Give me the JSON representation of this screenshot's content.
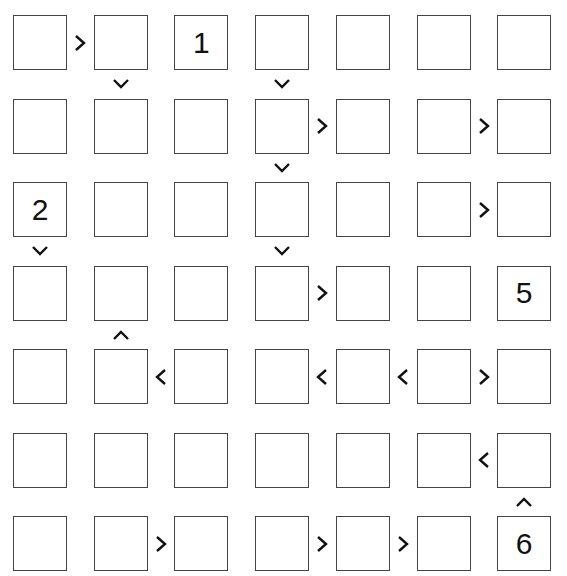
{
  "puzzle": {
    "type": "futoshiki",
    "size": 7,
    "grid": [
      [
        "",
        "",
        "1",
        "",
        "",
        "",
        ""
      ],
      [
        "",
        "",
        "",
        "",
        "",
        "",
        ""
      ],
      [
        "2",
        "",
        "",
        "",
        "",
        "",
        ""
      ],
      [
        "",
        "",
        "",
        "",
        "",
        "",
        "5"
      ],
      [
        "",
        "",
        "",
        "",
        "",
        "",
        ""
      ],
      [
        "",
        "",
        "",
        "",
        "",
        "",
        ""
      ],
      [
        "",
        "",
        "",
        "",
        "",
        "",
        "6"
      ]
    ],
    "horizontal_constraints": [
      {
        "row": 0,
        "col": 0,
        "sign": ">"
      },
      {
        "row": 1,
        "col": 3,
        "sign": ">"
      },
      {
        "row": 1,
        "col": 5,
        "sign": ">"
      },
      {
        "row": 2,
        "col": 5,
        "sign": ">"
      },
      {
        "row": 3,
        "col": 3,
        "sign": ">"
      },
      {
        "row": 4,
        "col": 1,
        "sign": "<"
      },
      {
        "row": 4,
        "col": 3,
        "sign": "<"
      },
      {
        "row": 4,
        "col": 4,
        "sign": "<"
      },
      {
        "row": 4,
        "col": 5,
        "sign": ">"
      },
      {
        "row": 5,
        "col": 5,
        "sign": "<"
      },
      {
        "row": 6,
        "col": 1,
        "sign": ">"
      },
      {
        "row": 6,
        "col": 3,
        "sign": ">"
      },
      {
        "row": 6,
        "col": 4,
        "sign": ">"
      }
    ],
    "vertical_constraints": [
      {
        "row": 0,
        "col": 1,
        "sign": "v"
      },
      {
        "row": 0,
        "col": 3,
        "sign": "v"
      },
      {
        "row": 1,
        "col": 3,
        "sign": "v"
      },
      {
        "row": 2,
        "col": 0,
        "sign": "v"
      },
      {
        "row": 2,
        "col": 3,
        "sign": "v"
      },
      {
        "row": 3,
        "col": 1,
        "sign": "^"
      },
      {
        "row": 5,
        "col": 6,
        "sign": "^"
      }
    ]
  }
}
